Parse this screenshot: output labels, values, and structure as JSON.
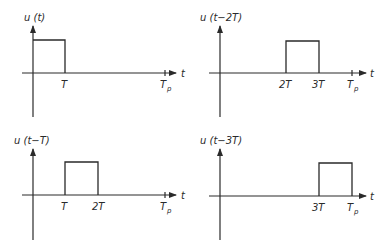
{
  "diagram": {
    "type": "signal-plots",
    "panels": [
      {
        "id": "u-t",
        "title": "u (t)",
        "xlabel": "t",
        "ticks": [
          {
            "label": "T"
          },
          {
            "label": "T",
            "sub": "p"
          }
        ],
        "pulse_start_label": "0",
        "pulse_end_label": "T"
      },
      {
        "id": "u-t-2T",
        "title": "u (t−2T)",
        "xlabel": "t",
        "ticks": [
          {
            "label": "2T"
          },
          {
            "label": "3T"
          },
          {
            "label": "T",
            "sub": "p"
          }
        ],
        "pulse_start_label": "2T",
        "pulse_end_label": "3T"
      },
      {
        "id": "u-t-T",
        "title": "u (t−T)",
        "xlabel": "t",
        "ticks": [
          {
            "label": "T"
          },
          {
            "label": "2T"
          },
          {
            "label": "T",
            "sub": "p"
          }
        ],
        "pulse_start_label": "T",
        "pulse_end_label": "2T"
      },
      {
        "id": "u-t-3T",
        "title": "u (t−3T)",
        "xlabel": "t",
        "ticks": [
          {
            "label": "3T"
          },
          {
            "label": "T",
            "sub": "p"
          }
        ],
        "pulse_start_label": "3T",
        "pulse_end_label": "Tp"
      }
    ]
  }
}
